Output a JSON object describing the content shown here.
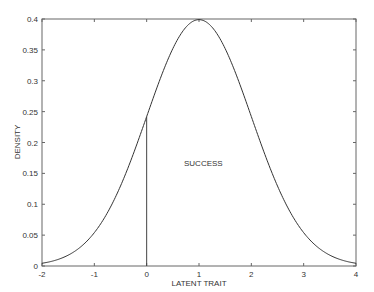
{
  "chart_data": {
    "type": "line",
    "title": "",
    "xlabel": "LATENT TRAIT",
    "ylabel": "DENSITY",
    "xlim": [
      -2,
      4
    ],
    "ylim": [
      0,
      0.4
    ],
    "grid": false,
    "legend": null,
    "x_ticks": [
      "-2",
      "-1",
      "0",
      "1",
      "2",
      "3",
      "4"
    ],
    "y_ticks": [
      "0",
      "0.05",
      "0.1",
      "0.15",
      "0.2",
      "0.25",
      "0.3",
      "0.35",
      "0.4"
    ],
    "series": [
      {
        "name": "Normal density (mean 1, sd 1)",
        "x": [
          -2,
          -1.5,
          -1,
          -0.5,
          0,
          0.5,
          1,
          1.5,
          2,
          2.5,
          3,
          3.5,
          4
        ],
        "y": [
          0.0044,
          0.0175,
          0.054,
          0.1295,
          0.242,
          0.3521,
          0.3989,
          0.3521,
          0.242,
          0.1295,
          0.054,
          0.0175,
          0.0044
        ]
      }
    ],
    "threshold": {
      "x": 0,
      "y": 0.242
    },
    "annotations": [
      {
        "text": "SUCCESS",
        "x": 1.0,
        "y": 0.2
      }
    ]
  },
  "axes": {
    "x_label": "LATENT TRAIT",
    "y_label": "DENSITY"
  },
  "annotation_text": "SUCCESS",
  "colors": {
    "curve": "#333333",
    "axis": "#555555",
    "background": "#ffffff"
  }
}
